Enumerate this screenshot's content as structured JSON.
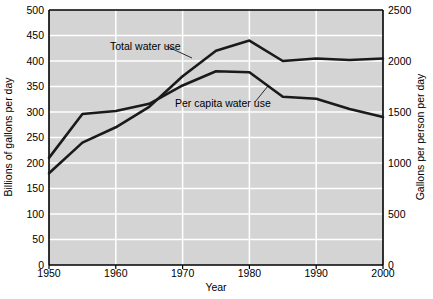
{
  "chart_data": {
    "type": "line",
    "title": "",
    "xlabel": "Year",
    "ylabel": "Billions of gallons per day",
    "ylabel_right": "Gallons per person per day",
    "x": [
      1950,
      1955,
      1960,
      1965,
      1970,
      1975,
      1980,
      1985,
      1990,
      1995,
      2000
    ],
    "xlim": [
      1950,
      2000
    ],
    "xticks": [
      1950,
      1960,
      1970,
      1980,
      1990,
      2000
    ],
    "xtick_labels": [
      "1950",
      "1960",
      "1970",
      "1980",
      "1990",
      "2000"
    ],
    "ylim": [
      0,
      500
    ],
    "yticks": [
      0,
      50,
      100,
      150,
      200,
      250,
      300,
      350,
      400,
      450,
      500
    ],
    "ytick_labels": [
      "0",
      "50",
      "100",
      "150",
      "200",
      "250",
      "300",
      "350",
      "400",
      "450",
      "500"
    ],
    "ylim_right": [
      0,
      2500
    ],
    "yticks_right": [
      0,
      500,
      1000,
      1500,
      2000,
      2500
    ],
    "ytick_labels_right": [
      "0",
      "500",
      "1000",
      "1500",
      "2000",
      "2500"
    ],
    "grid": true,
    "grid_color": "#ffffff",
    "plot_background": "#d4d4d4",
    "line_color": "#1a1a1a",
    "legend": "annotations",
    "series": [
      {
        "name": "Total water use",
        "axis": "left",
        "units": "billions of gallons per day",
        "values": [
          180,
          240,
          270,
          310,
          370,
          420,
          440,
          400,
          405,
          402,
          405
        ]
      },
      {
        "name": "Per capita water use",
        "axis": "right",
        "units": "gallons per person per day",
        "values": [
          1050,
          1480,
          1510,
          1580,
          1760,
          1900,
          1890,
          1650,
          1630,
          1530,
          1450
        ]
      }
    ],
    "annotations": [
      {
        "text": "Total water use",
        "x_px": 110,
        "y_px": 50
      },
      {
        "text": "Per capita water use",
        "x_px": 175,
        "y_px": 107
      }
    ]
  }
}
